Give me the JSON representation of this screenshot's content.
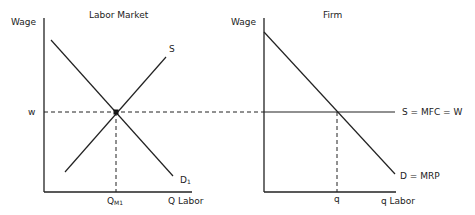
{
  "left_panel": {
    "title": "Labor Market",
    "y_axis_label": "Wage",
    "x_axis_label": "Q Labor",
    "wage_label": "w",
    "quantity_label_main": "Q",
    "quantity_label_sub": "M1",
    "supply_label": "S",
    "demand_label_main": "D",
    "demand_label_sub": "1"
  },
  "right_panel": {
    "title": "Firm",
    "y_axis_label": "Wage",
    "x_axis_label": "q Labor",
    "quantity_label": "q",
    "supply_label": "S = MFC = W",
    "demand_label": "D = MRP"
  },
  "colors": {
    "line": "#222222",
    "background": "#ffffff"
  }
}
